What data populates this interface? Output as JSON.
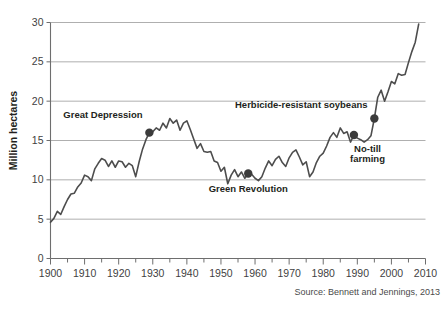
{
  "chart_data": {
    "type": "line",
    "title": "",
    "subtitle": "",
    "xlabel": "",
    "ylabel": "Million hectares",
    "xlim": [
      1900,
      2010
    ],
    "ylim": [
      0,
      30
    ],
    "grid": true,
    "legend": null,
    "source": "Source: Bennett and Jennings, 2013",
    "y_ticks": [
      0,
      5,
      10,
      15,
      20,
      25,
      30
    ],
    "y_tick_labels": [
      "0",
      "5",
      "10",
      "15",
      "20",
      "25",
      "30"
    ],
    "x_ticks": [
      1900,
      1910,
      1920,
      1930,
      1940,
      1950,
      1960,
      1970,
      1980,
      1990,
      2000,
      2010
    ],
    "x_tick_labels": [
      "1900",
      "1910",
      "1920",
      "1930",
      "1940",
      "1950",
      "1960",
      "1970",
      "1980",
      "1990",
      "2000",
      "2010"
    ],
    "x_minor_ticks": [
      1905,
      1915,
      1925,
      1935,
      1945,
      1955,
      1965,
      1975,
      1985,
      1995,
      2005
    ],
    "series": [
      {
        "name": "Million hectares",
        "color": "#4d4d4d",
        "x": [
          1900,
          1901,
          1902,
          1903,
          1904,
          1905,
          1906,
          1907,
          1908,
          1909,
          1910,
          1911,
          1912,
          1913,
          1914,
          1915,
          1916,
          1917,
          1918,
          1919,
          1920,
          1921,
          1922,
          1923,
          1924,
          1925,
          1926,
          1927,
          1928,
          1929,
          1930,
          1931,
          1932,
          1933,
          1934,
          1935,
          1936,
          1937,
          1938,
          1939,
          1940,
          1941,
          1942,
          1943,
          1944,
          1945,
          1946,
          1947,
          1948,
          1949,
          1950,
          1951,
          1952,
          1953,
          1954,
          1955,
          1956,
          1957,
          1958,
          1959,
          1960,
          1961,
          1962,
          1963,
          1964,
          1965,
          1966,
          1967,
          1968,
          1969,
          1970,
          1971,
          1972,
          1973,
          1974,
          1975,
          1976,
          1977,
          1978,
          1979,
          1980,
          1981,
          1982,
          1983,
          1984,
          1985,
          1986,
          1987,
          1988,
          1989,
          1990,
          1991,
          1992,
          1993,
          1994,
          1995,
          1996,
          1997,
          1998,
          1999,
          2000,
          2001,
          2002,
          2003,
          2004,
          2005,
          2006,
          2007,
          2008
        ],
        "values": [
          4.6,
          5.1,
          6.0,
          5.6,
          6.6,
          7.5,
          8.2,
          8.3,
          9.1,
          9.6,
          10.6,
          10.4,
          9.9,
          11.4,
          12.1,
          12.7,
          12.5,
          11.7,
          12.4,
          11.6,
          12.4,
          12.3,
          11.6,
          12.1,
          11.8,
          10.4,
          12.3,
          13.9,
          15.1,
          16.0,
          16.1,
          16.6,
          16.3,
          17.2,
          16.6,
          17.8,
          17.2,
          17.6,
          16.3,
          17.2,
          17.5,
          16.4,
          15.2,
          14.0,
          14.6,
          13.6,
          13.5,
          13.6,
          12.4,
          12.2,
          11.1,
          11.6,
          9.5,
          10.6,
          11.3,
          10.4,
          11.0,
          10.2,
          10.8,
          10.7,
          10.2,
          9.9,
          10.4,
          11.5,
          12.4,
          11.8,
          12.6,
          13.0,
          12.2,
          11.7,
          12.8,
          13.5,
          13.8,
          12.9,
          11.9,
          12.3,
          10.4,
          11.0,
          12.2,
          13.0,
          13.4,
          14.3,
          15.4,
          16.0,
          15.4,
          16.6,
          15.9,
          16.1,
          14.8,
          15.7,
          15.3,
          15.1,
          14.8,
          15.1,
          15.6,
          17.8,
          20.5,
          21.4,
          20.0,
          21.2,
          22.5,
          22.2,
          23.5,
          23.3,
          23.4,
          24.9,
          26.3,
          27.5,
          29.8
        ]
      }
    ],
    "annotations": [
      {
        "id": "great-depression",
        "label": "Great Depression",
        "point_x": 1929,
        "point_y": 16.0,
        "label_anchor": "end",
        "label_x": 1927,
        "label_y": 17.8
      },
      {
        "id": "green-revolution",
        "label": "Green Revolution",
        "point_x": 1958,
        "point_y": 10.8,
        "label_anchor": "middle",
        "label_x": 1958,
        "label_y": 8.4
      },
      {
        "id": "herbicide-resistant-soybeans",
        "label": "Herbicide-resistant soybeans",
        "point_x": 1995,
        "point_y": 17.8,
        "label_anchor": "end",
        "label_x": 1993,
        "label_y": 19.1
      },
      {
        "id": "no-till-farming",
        "label": "No-till farming",
        "label_line_1": "No-till",
        "label_line_2": "farming",
        "point_x": 1989,
        "point_y": 15.7,
        "label_anchor": "middle",
        "label_x": 1993,
        "label_y": 13.5
      }
    ]
  },
  "figure": {
    "y_axis_title": "Million hectares",
    "source_note": "Source: Bennett and Jennings, 2013",
    "colors": {
      "line": "#4d4d4d",
      "grid": "#9b9b9b",
      "marker": "#3b3b3b",
      "text": "#231f20",
      "background": "#ffffff"
    }
  }
}
